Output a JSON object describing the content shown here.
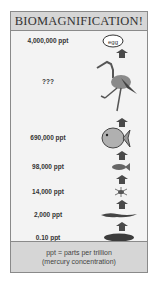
{
  "title": "BIOMAGNIFICATION!",
  "levels": [
    {
      "label": "4,000,000 ppt",
      "organism": "egg",
      "icon_text": "egg"
    },
    {
      "label": "???",
      "organism": "bird"
    },
    {
      "label": "690,000 ppt",
      "organism": "large-fish"
    },
    {
      "label": "98,000 ppt",
      "organism": "small-fish"
    },
    {
      "label": "14,000 ppt",
      "organism": "zooplankton"
    },
    {
      "label": "2,000 ppt",
      "organism": "algae"
    },
    {
      "label": "0.10 ppt",
      "organism": "water"
    }
  ],
  "legend": {
    "line1": "ppt = parts per trillion",
    "line2": "(mercury concentration)"
  },
  "colors": {
    "frame_bg": "#f3f3f3",
    "header_bg": "#d6d6d6",
    "icon_dark": "#3c3c3c",
    "icon_mid": "#7a7a7a"
  }
}
